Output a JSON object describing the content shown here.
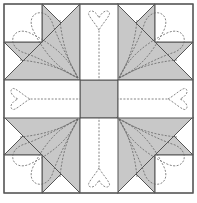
{
  "colors": {
    "background": "#ffffff",
    "fabric_gray": "#c8c8c8",
    "seam": "#555555",
    "quilting": "#666666"
  },
  "block": {
    "x": 4,
    "y": 4,
    "size": 189,
    "grid": 5,
    "center_square": "gray",
    "corner_units": [
      "top-left",
      "top-right",
      "bottom-left",
      "bottom-right"
    ],
    "side_hearts": [
      "top",
      "right",
      "bottom",
      "left"
    ]
  }
}
